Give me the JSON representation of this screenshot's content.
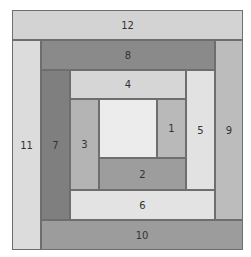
{
  "pieces": [
    {
      "id": "center",
      "label": "",
      "color": "#ececec"
    },
    {
      "id": "p1",
      "label": "1",
      "color": "#b9b9b9"
    },
    {
      "id": "p2",
      "label": "2",
      "color": "#9d9d9d"
    },
    {
      "id": "p3",
      "label": "3",
      "color": "#b4b4b4"
    },
    {
      "id": "p4",
      "label": "4",
      "color": "#d6d6d6"
    },
    {
      "id": "p5",
      "label": "5",
      "color": "#e2e2e2"
    },
    {
      "id": "p6",
      "label": "6",
      "color": "#e3e3e3"
    },
    {
      "id": "p7",
      "label": "7",
      "color": "#7f7f7f"
    },
    {
      "id": "p8",
      "label": "8",
      "color": "#8a8a8a"
    },
    {
      "id": "p9",
      "label": "9",
      "color": "#bcbcbc"
    },
    {
      "id": "p10",
      "label": "10",
      "color": "#9c9c9c"
    },
    {
      "id": "p11",
      "label": "11",
      "color": "#dcdcdc"
    },
    {
      "id": "p12",
      "label": "12",
      "color": "#d3d3d3"
    }
  ]
}
